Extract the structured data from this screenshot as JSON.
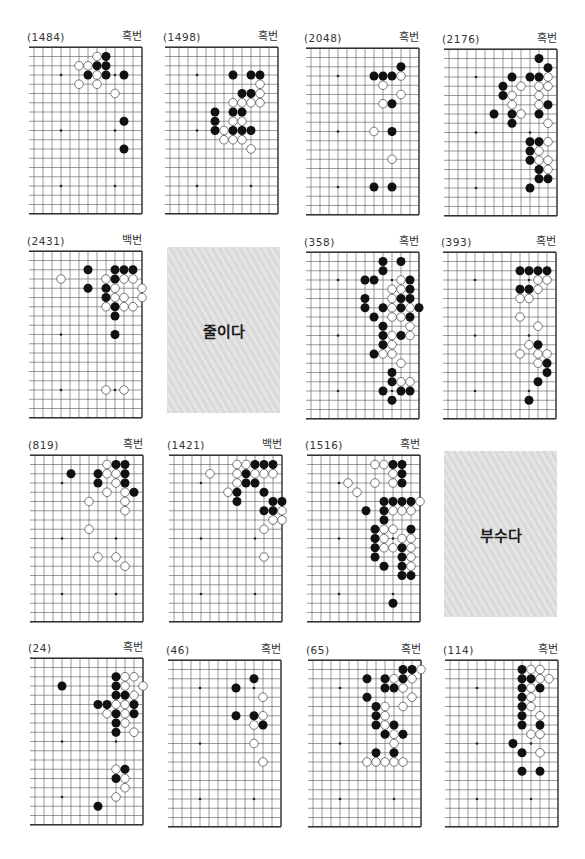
{
  "page": {
    "type": "go-problem-collection"
  },
  "boards": [
    {
      "number": "(1484)",
      "turn": "흑번",
      "black": [
        [
          4,
          1
        ],
        [
          5,
          2
        ],
        [
          4,
          2
        ],
        [
          6,
          3
        ],
        [
          4,
          3
        ],
        [
          2,
          3
        ],
        [
          2,
          8
        ],
        [
          2,
          11
        ]
      ],
      "white": [
        [
          5,
          1
        ],
        [
          7,
          2
        ],
        [
          6,
          2
        ],
        [
          5,
          3
        ],
        [
          7,
          4
        ],
        [
          5,
          4
        ],
        [
          3,
          5
        ]
      ]
    },
    {
      "number": "(1498)",
      "turn": "흑번",
      "black": [
        [
          5,
          3
        ],
        [
          3,
          3
        ],
        [
          2,
          3
        ],
        [
          4,
          5
        ],
        [
          3,
          5
        ],
        [
          7,
          7
        ],
        [
          5,
          7
        ],
        [
          4,
          7
        ],
        [
          7,
          8
        ],
        [
          7,
          9
        ],
        [
          5,
          9
        ],
        [
          4,
          9
        ],
        [
          3,
          9
        ]
      ],
      "white": [
        [
          2,
          4
        ],
        [
          2,
          5
        ],
        [
          5,
          6
        ],
        [
          4,
          6
        ],
        [
          3,
          6
        ],
        [
          2,
          6
        ],
        [
          5,
          8
        ],
        [
          4,
          8
        ],
        [
          6,
          9
        ],
        [
          6,
          10
        ],
        [
          5,
          10
        ],
        [
          4,
          10
        ],
        [
          3,
          11
        ]
      ]
    },
    {
      "number": "(2048)",
      "turn": "흑번",
      "black": [
        [
          2,
          2
        ],
        [
          5,
          3
        ],
        [
          4,
          3
        ],
        [
          3,
          3
        ],
        [
          3,
          6
        ],
        [
          3,
          9
        ],
        [
          5,
          15
        ],
        [
          3,
          15
        ]
      ],
      "white": [
        [
          2,
          3
        ],
        [
          4,
          4
        ],
        [
          2,
          5
        ],
        [
          4,
          6
        ],
        [
          5,
          9
        ],
        [
          3,
          12
        ]
      ]
    },
    {
      "number": "(2176)",
      "turn": "흑번",
      "black": [
        [
          2,
          1
        ],
        [
          1,
          2
        ],
        [
          5,
          3
        ],
        [
          3,
          3
        ],
        [
          2,
          3
        ],
        [
          6,
          4
        ],
        [
          6,
          5
        ],
        [
          1,
          6
        ],
        [
          7,
          7
        ],
        [
          5,
          7
        ],
        [
          2,
          7
        ],
        [
          5,
          8
        ],
        [
          3,
          10
        ],
        [
          2,
          10
        ],
        [
          3,
          11
        ],
        [
          3,
          12
        ],
        [
          2,
          13
        ],
        [
          2,
          14
        ],
        [
          1,
          14
        ],
        [
          3,
          15
        ]
      ],
      "white": [
        [
          1,
          3
        ],
        [
          4,
          4
        ],
        [
          2,
          4
        ],
        [
          1,
          4
        ],
        [
          5,
          5
        ],
        [
          2,
          5
        ],
        [
          5,
          6
        ],
        [
          2,
          6
        ],
        [
          4,
          7
        ],
        [
          1,
          8
        ],
        [
          1,
          10
        ],
        [
          2,
          11
        ],
        [
          2,
          12
        ],
        [
          1,
          12
        ],
        [
          1,
          13
        ]
      ]
    },
    {
      "number": "(2431)",
      "turn": "백번",
      "black": [
        [
          6,
          2
        ],
        [
          3,
          2
        ],
        [
          2,
          2
        ],
        [
          1,
          2
        ],
        [
          3,
          3
        ],
        [
          6,
          4
        ],
        [
          4,
          4
        ],
        [
          4,
          5
        ],
        [
          3,
          6
        ],
        [
          3,
          7
        ],
        [
          3,
          9
        ]
      ],
      "white": [
        [
          9,
          3
        ],
        [
          4,
          3
        ],
        [
          2,
          3
        ],
        [
          1,
          3
        ],
        [
          3,
          4
        ],
        [
          0,
          4
        ],
        [
          3,
          5
        ],
        [
          2,
          5
        ],
        [
          0,
          5
        ],
        [
          4,
          6
        ],
        [
          2,
          6
        ],
        [
          1,
          6
        ],
        [
          4,
          15
        ],
        [
          2,
          15
        ]
      ]
    },
    {
      "number": "(358)",
      "turn": "흑번",
      "black": [
        [
          4,
          1
        ],
        [
          2,
          1
        ],
        [
          4,
          2
        ],
        [
          6,
          3
        ],
        [
          5,
          3
        ],
        [
          1,
          3
        ],
        [
          1,
          4
        ],
        [
          6,
          5
        ],
        [
          2,
          5
        ],
        [
          1,
          5
        ],
        [
          6,
          6
        ],
        [
          4,
          6
        ],
        [
          2,
          6
        ],
        [
          0,
          6
        ],
        [
          5,
          7
        ],
        [
          1,
          7
        ],
        [
          4,
          8
        ],
        [
          4,
          9
        ],
        [
          2,
          9
        ],
        [
          4,
          10
        ],
        [
          5,
          11
        ],
        [
          3,
          13
        ],
        [
          3,
          14
        ],
        [
          4,
          15
        ],
        [
          2,
          15
        ],
        [
          1,
          15
        ],
        [
          3,
          16
        ]
      ],
      "white": [
        [
          2,
          3
        ],
        [
          3,
          4
        ],
        [
          2,
          4
        ],
        [
          3,
          5
        ],
        [
          3,
          6
        ],
        [
          1,
          6
        ],
        [
          3,
          7
        ],
        [
          2,
          7
        ],
        [
          1,
          8
        ],
        [
          3,
          9
        ],
        [
          1,
          9
        ],
        [
          3,
          10
        ],
        [
          4,
          11
        ],
        [
          3,
          11
        ],
        [
          2,
          12
        ],
        [
          2,
          14
        ],
        [
          1,
          14
        ]
      ]
    },
    {
      "number": "(393)",
      "turn": "흑번",
      "black": [
        [
          4,
          2
        ],
        [
          3,
          2
        ],
        [
          2,
          2
        ],
        [
          1,
          2
        ],
        [
          4,
          4
        ],
        [
          3,
          4
        ],
        [
          2,
          10
        ],
        [
          1,
          12
        ],
        [
          1,
          13
        ],
        [
          2,
          14
        ],
        [
          3,
          16
        ]
      ],
      "white": [
        [
          2,
          3
        ],
        [
          1,
          3
        ],
        [
          2,
          4
        ],
        [
          4,
          5
        ],
        [
          3,
          5
        ],
        [
          4,
          7
        ],
        [
          2,
          8
        ],
        [
          3,
          10
        ],
        [
          4,
          11
        ],
        [
          2,
          11
        ],
        [
          1,
          11
        ],
        [
          2,
          12
        ]
      ]
    },
    {
      "number": "(819)",
      "turn": "흑번",
      "black": [
        [
          3,
          1
        ],
        [
          2,
          1
        ],
        [
          8,
          2
        ],
        [
          5,
          2
        ],
        [
          2,
          2
        ],
        [
          5,
          3
        ],
        [
          2,
          3
        ],
        [
          1,
          4
        ]
      ],
      "white": [
        [
          4,
          1
        ],
        [
          4,
          2
        ],
        [
          3,
          2
        ],
        [
          3,
          3
        ],
        [
          4,
          4
        ],
        [
          2,
          4
        ],
        [
          6,
          5
        ],
        [
          2,
          5
        ],
        [
          2,
          6
        ],
        [
          6,
          8
        ],
        [
          5,
          11
        ],
        [
          3,
          11
        ],
        [
          2,
          12
        ]
      ]
    },
    {
      "number": "(1421)",
      "turn": "백번",
      "black": [
        [
          3,
          1
        ],
        [
          2,
          1
        ],
        [
          1,
          1
        ],
        [
          4,
          2
        ],
        [
          4,
          3
        ],
        [
          3,
          3
        ],
        [
          5,
          4
        ],
        [
          2,
          4
        ],
        [
          5,
          5
        ],
        [
          1,
          5
        ],
        [
          0,
          5
        ],
        [
          2,
          6
        ],
        [
          1,
          6
        ]
      ],
      "white": [
        [
          5,
          1
        ],
        [
          4,
          1
        ],
        [
          8,
          2
        ],
        [
          5,
          2
        ],
        [
          3,
          2
        ],
        [
          2,
          2
        ],
        [
          1,
          2
        ],
        [
          5,
          3
        ],
        [
          6,
          4
        ],
        [
          0,
          6
        ],
        [
          1,
          7
        ],
        [
          0,
          7
        ],
        [
          2,
          8
        ],
        [
          2,
          11
        ]
      ]
    },
    {
      "number": "(1516)",
      "turn": "흑번",
      "black": [
        [
          3,
          1
        ],
        [
          2,
          1
        ],
        [
          2,
          2
        ],
        [
          2,
          3
        ],
        [
          4,
          5
        ],
        [
          3,
          5
        ],
        [
          2,
          5
        ],
        [
          1,
          5
        ],
        [
          6,
          6
        ],
        [
          4,
          6
        ],
        [
          4,
          7
        ],
        [
          5,
          8
        ],
        [
          1,
          8
        ],
        [
          5,
          9
        ],
        [
          5,
          10
        ],
        [
          2,
          10
        ],
        [
          5,
          11
        ],
        [
          2,
          11
        ],
        [
          4,
          12
        ],
        [
          2,
          12
        ],
        [
          2,
          13
        ],
        [
          1,
          13
        ],
        [
          3,
          16
        ]
      ],
      "white": [
        [
          5,
          1
        ],
        [
          4,
          1
        ],
        [
          3,
          2
        ],
        [
          8,
          3
        ],
        [
          5,
          3
        ],
        [
          3,
          3
        ],
        [
          7,
          4
        ],
        [
          0,
          5
        ],
        [
          3,
          6
        ],
        [
          2,
          6
        ],
        [
          1,
          6
        ],
        [
          4,
          8
        ],
        [
          3,
          8
        ],
        [
          4,
          9
        ],
        [
          2,
          9
        ],
        [
          1,
          9
        ],
        [
          4,
          10
        ],
        [
          3,
          10
        ],
        [
          1,
          10
        ],
        [
          1,
          11
        ],
        [
          1,
          12
        ]
      ]
    },
    {
      "number": "(24)",
      "turn": "흑번",
      "black": [
        [
          3,
          2
        ],
        [
          9,
          3
        ],
        [
          3,
          3
        ],
        [
          3,
          4
        ],
        [
          2,
          4
        ],
        [
          5,
          5
        ],
        [
          4,
          5
        ],
        [
          1,
          5
        ],
        [
          3,
          6
        ],
        [
          1,
          6
        ],
        [
          3,
          7
        ],
        [
          3,
          8
        ],
        [
          2,
          12
        ],
        [
          3,
          13
        ],
        [
          5,
          16
        ]
      ],
      "white": [
        [
          2,
          2
        ],
        [
          1,
          2
        ],
        [
          2,
          3
        ],
        [
          0,
          3
        ],
        [
          1,
          4
        ],
        [
          3,
          5
        ],
        [
          2,
          5
        ],
        [
          4,
          6
        ],
        [
          2,
          6
        ],
        [
          2,
          7
        ],
        [
          1,
          8
        ],
        [
          3,
          12
        ],
        [
          2,
          13
        ],
        [
          2,
          14
        ],
        [
          3,
          15
        ]
      ]
    },
    {
      "number": "(46)",
      "turn": "흑번",
      "black": [
        [
          3,
          2
        ],
        [
          5,
          3
        ],
        [
          5,
          6
        ],
        [
          3,
          6
        ],
        [
          2,
          7
        ]
      ],
      "white": [
        [
          2,
          4
        ],
        [
          2,
          6
        ],
        [
          3,
          7
        ],
        [
          3,
          9
        ],
        [
          2,
          11
        ]
      ]
    },
    {
      "number": "(65)",
      "turn": "흑번",
      "black": [
        [
          2,
          1
        ],
        [
          1,
          1
        ],
        [
          6,
          2
        ],
        [
          4,
          2
        ],
        [
          2,
          2
        ],
        [
          4,
          3
        ],
        [
          3,
          3
        ],
        [
          6,
          4
        ],
        [
          5,
          5
        ],
        [
          5,
          6
        ],
        [
          5,
          7
        ],
        [
          3,
          7
        ],
        [
          4,
          8
        ],
        [
          2,
          8
        ],
        [
          5,
          10
        ],
        [
          3,
          10
        ]
      ],
      "white": [
        [
          0,
          1
        ],
        [
          3,
          2
        ],
        [
          1,
          2
        ],
        [
          2,
          3
        ],
        [
          1,
          4
        ],
        [
          4,
          5
        ],
        [
          2,
          5
        ],
        [
          4,
          6
        ],
        [
          4,
          7
        ],
        [
          3,
          8
        ],
        [
          3,
          9
        ],
        [
          6,
          11
        ],
        [
          5,
          11
        ],
        [
          4,
          11
        ],
        [
          3,
          11
        ],
        [
          2,
          11
        ]
      ]
    },
    {
      "number": "(114)",
      "turn": "흑번",
      "black": [
        [
          4,
          1
        ],
        [
          4,
          2
        ],
        [
          3,
          2
        ],
        [
          4,
          3
        ],
        [
          2,
          3
        ],
        [
          4,
          4
        ],
        [
          4,
          5
        ],
        [
          4,
          6
        ],
        [
          4,
          7
        ],
        [
          2,
          7
        ],
        [
          5,
          9
        ],
        [
          4,
          10
        ],
        [
          4,
          12
        ],
        [
          2,
          12
        ]
      ],
      "white": [
        [
          3,
          1
        ],
        [
          2,
          1
        ],
        [
          2,
          2
        ],
        [
          1,
          2
        ],
        [
          3,
          3
        ],
        [
          3,
          4
        ],
        [
          3,
          5
        ],
        [
          2,
          6
        ],
        [
          3,
          8
        ],
        [
          2,
          8
        ],
        [
          2,
          10
        ]
      ]
    }
  ],
  "word_boxes": [
    {
      "text": "줄이다"
    },
    {
      "text": "부수다"
    }
  ],
  "colors": {
    "black_stone": "#111111",
    "white_stone": "#ffffff",
    "grid": "#555555"
  }
}
